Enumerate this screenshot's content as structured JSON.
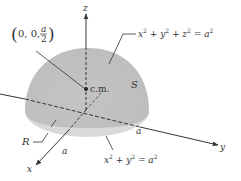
{
  "figure": {
    "colors": {
      "background": "#ffffff",
      "solid_fill": "#c8c8c8",
      "solid_fill_light": "#dcdcdc",
      "line": "#333333"
    },
    "axes": {
      "x_label": "x",
      "y_label": "y",
      "z_label": "z"
    },
    "labels": {
      "cm_coord_open": "(",
      "cm_coord_prefix": "0, 0, ",
      "cm_coord_num": "a",
      "cm_coord_den": "2",
      "cm_coord_close": ")",
      "cm": "c.m.",
      "surface_name": "S",
      "sphere_eq": {
        "x": "x",
        "plus1": " + ",
        "y": "y",
        "plus2": " + ",
        "z": "z",
        "eq": " = ",
        "a": "a",
        "exp": "2"
      },
      "region_name": "R",
      "radius_x": "a",
      "radius_y": "a",
      "disk_eq": {
        "x": "x",
        "plus": " + ",
        "y": "y",
        "eq": " = ",
        "a": "a",
        "exp": "2"
      }
    }
  }
}
